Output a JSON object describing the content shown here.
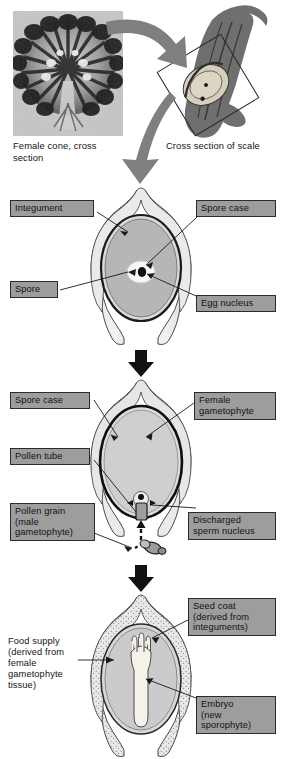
{
  "figure": {
    "background": "#ffffff"
  },
  "captions": {
    "female_cone": "Female cone, cross\nsection",
    "cross_section_scale": "Cross section of scale"
  },
  "stages": [
    {
      "id": "stage-ovule",
      "name": "Ovule with spore and egg nucleus",
      "labels": [
        {
          "id": "integument",
          "text": "Integument",
          "boxed": true
        },
        {
          "id": "spore-case",
          "text": "Spore case",
          "boxed": true
        },
        {
          "id": "spore",
          "text": "Spore",
          "boxed": true
        },
        {
          "id": "egg-nucleus",
          "text": "Egg nucleus",
          "boxed": true
        }
      ]
    },
    {
      "id": "stage-fertilization",
      "name": "Ovule with pollen tube and female gametophyte",
      "labels": [
        {
          "id": "spore-case-2",
          "text": "Spore case",
          "boxed": true
        },
        {
          "id": "female-gametophyte",
          "text": "Female\ngametophyte",
          "boxed": true
        },
        {
          "id": "pollen-tube",
          "text": "Pollen tube",
          "boxed": true
        },
        {
          "id": "pollen-grain",
          "text": "Pollen grain\n(male\ngametophyte)",
          "boxed": true
        },
        {
          "id": "discharged-sperm",
          "text": "Discharged\nsperm nucleus",
          "boxed": true
        }
      ]
    },
    {
      "id": "stage-seed",
      "name": "Mature seed with embryo",
      "labels": [
        {
          "id": "seed-coat",
          "text": "Seed coat\n(derived from\ninteguments)",
          "boxed": true
        },
        {
          "id": "food-supply",
          "text": "Food supply\n(derived from\nfemale\ngametophyte\ntissue)",
          "boxed": false
        },
        {
          "id": "embryo",
          "text": "Embryo\n(new\nsporophyte)",
          "boxed": true
        }
      ]
    }
  ],
  "label_text": {
    "integument": "Integument",
    "spore_case": "Spore case",
    "spore": "Spore",
    "egg_nucleus": "Egg nucleus",
    "spore_case_2": "Spore case",
    "female_gametophyte": "Female\ngametophyte",
    "pollen_tube": "Pollen tube",
    "pollen_grain": "Pollen grain\n(male\ngametophyte)",
    "discharged_sperm": "Discharged\nsperm nucleus",
    "seed_coat": "Seed coat\n(derived from\ninteguments)",
    "food_supply": "Food supply\n(derived from\nfemale\ngametophyte\ntissue)",
    "embryo": "Embryo\n(new\nsporophyte)"
  },
  "colors": {
    "label_box_fill": "#9d9d9d",
    "label_box_border": "#2b2b2b",
    "text": "#141414",
    "integument_fill": "#dedede",
    "spore_case_outline": "#1a1a1a",
    "gametophyte_fill": "#b4b4b4",
    "spore_fill": "#f4f4f4",
    "nucleus_fill": "#111111",
    "big_arrow_fill": "#8a8a8a",
    "small_arrow_fill": "#111111",
    "seed_coat_fill": "#e4e4e4",
    "embryo_fill": "#f2efe6",
    "photo_background": "#bdbdbd",
    "scale_fill": "#6f6f6f"
  },
  "icons": {
    "big_curved_arrow": "curved-arrow-icon",
    "stage_arrow": "down-arrow-icon",
    "leader_line": "leader-line-icon"
  }
}
